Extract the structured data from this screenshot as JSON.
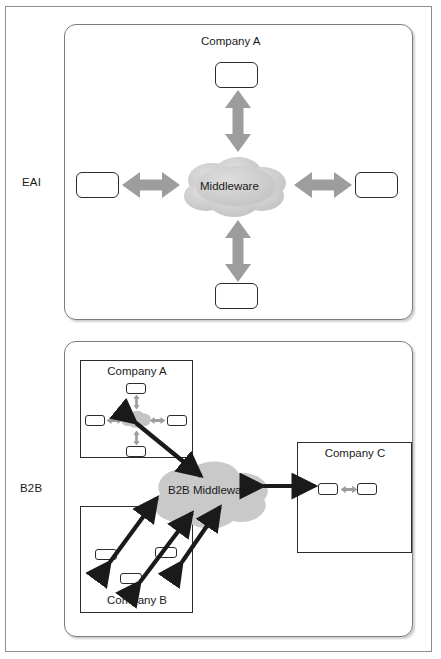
{
  "diagram": {
    "row_labels": {
      "eai": "EAI",
      "b2b": "B2B"
    },
    "colors": {
      "cloud_fill": "#c9c9c9",
      "gray_arrow": "#9a9a9a",
      "black_arrow": "#1a1a1a",
      "box_border": "#2b2b2b",
      "frame_border": "#8d8d8d",
      "background": "#ffffff"
    },
    "eai": {
      "label": "EAI",
      "company_title": "Company A",
      "middleware_label": "Middleware",
      "application_count": 4,
      "arrow_style": "gray double-headed block arrows",
      "arrow_directions": [
        "up",
        "down",
        "left",
        "right"
      ]
    },
    "b2b": {
      "label": "B2B",
      "middleware_label": "B2B Middleware",
      "companies": [
        {
          "name": "Company A",
          "internal_middleware": true,
          "application_count": 4,
          "connected_to_b2b": true,
          "connector_count": 1
        },
        {
          "name": "Company B",
          "internal_middleware": false,
          "application_count": 3,
          "connected_to_b2b": true,
          "connector_count": 3
        },
        {
          "name": "Company C",
          "internal_middleware": false,
          "application_count": 2,
          "connected_to_b2b": true,
          "connector_count": 1
        }
      ]
    }
  }
}
